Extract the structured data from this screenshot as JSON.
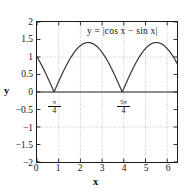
{
  "chart_data": {
    "type": "line",
    "title": "",
    "equation_label": "y = |cos x − sin x|",
    "xlabel": "x",
    "ylabel": "y",
    "xlim": [
      0,
      6.45
    ],
    "ylim": [
      -2,
      2
    ],
    "xticks": [
      0,
      1,
      2,
      3,
      4,
      5,
      6
    ],
    "xtick_labels": [
      "0",
      "1",
      "2",
      "3",
      "4",
      "5",
      "6"
    ],
    "yticks": [
      -2,
      -1.5,
      -1,
      -0.5,
      0,
      0.5,
      1,
      1.5,
      2
    ],
    "ytick_labels": [
      "−2",
      "−1.5",
      "−1",
      "−0.5",
      "0",
      "0.5",
      "1",
      "1.5",
      "2"
    ],
    "grid": true,
    "grid_style": "dotted",
    "legend": "none",
    "series": [
      {
        "name": "|cos x - sin x|",
        "color": "#3a3a3a",
        "x": [
          0.0,
          0.1,
          0.2,
          0.3,
          0.4,
          0.5,
          0.6,
          0.7,
          0.7854,
          0.9,
          1.0,
          1.1,
          1.2,
          1.3,
          1.4,
          1.5,
          1.6,
          1.7,
          1.8,
          1.9,
          2.0,
          2.1,
          2.2,
          2.3,
          2.3562,
          2.5,
          2.6,
          2.7,
          2.8,
          2.9,
          3.0,
          3.1,
          3.2,
          3.3,
          3.4,
          3.5,
          3.6,
          3.7,
          3.8,
          3.9,
          3.927,
          4.1,
          4.2,
          4.3,
          4.4,
          4.5,
          4.6,
          4.7,
          4.8,
          4.9,
          5.0,
          5.1,
          5.2,
          5.3,
          5.4,
          5.4978,
          5.6,
          5.7,
          5.8,
          5.9,
          6.0,
          6.1,
          6.2,
          6.2832,
          6.45
        ],
        "y": [
          1.0,
          0.8953,
          0.7815,
          0.6598,
          0.5314,
          0.3975,
          0.2596,
          0.119,
          0.0,
          0.1644,
          0.3012,
          0.4366,
          0.5699,
          0.7001,
          0.8267,
          0.9488,
          1.0658,
          1.1771,
          1.282,
          1.38,
          1.4104,
          1.4104,
          1.4104,
          1.4142,
          1.4142,
          1.38,
          1.282,
          1.1771,
          1.0658,
          0.9488,
          0.8267,
          0.7001,
          0.5699,
          0.4366,
          0.3012,
          0.1644,
          0.0266,
          0.1119,
          0.2494,
          0.3851,
          0.0,
          0.4366,
          0.5699,
          0.7001,
          0.8267,
          0.9488,
          1.0658,
          1.1771,
          1.282,
          1.38,
          1.38,
          1.4142,
          1.4142,
          1.38,
          1.282,
          1.4142,
          1.282,
          1.1771,
          1.0658,
          0.9488,
          0.8267,
          0.7001,
          0.5699,
          1.0,
          1.0
        ]
      }
    ],
    "annotations": [
      {
        "name": "first-zero",
        "text_numerator": "π",
        "text_denominator": "4",
        "x": 0.7854,
        "y": -0.18
      },
      {
        "name": "second-zero",
        "text_numerator": "5π",
        "text_denominator": "4",
        "x": 3.927,
        "y": -0.18
      }
    ],
    "colors": {
      "curve": "#3a3a3a",
      "axis": "#1a1a1a",
      "grid": "#9a9a9a",
      "text": "#141414",
      "background": "#ffffff"
    }
  }
}
